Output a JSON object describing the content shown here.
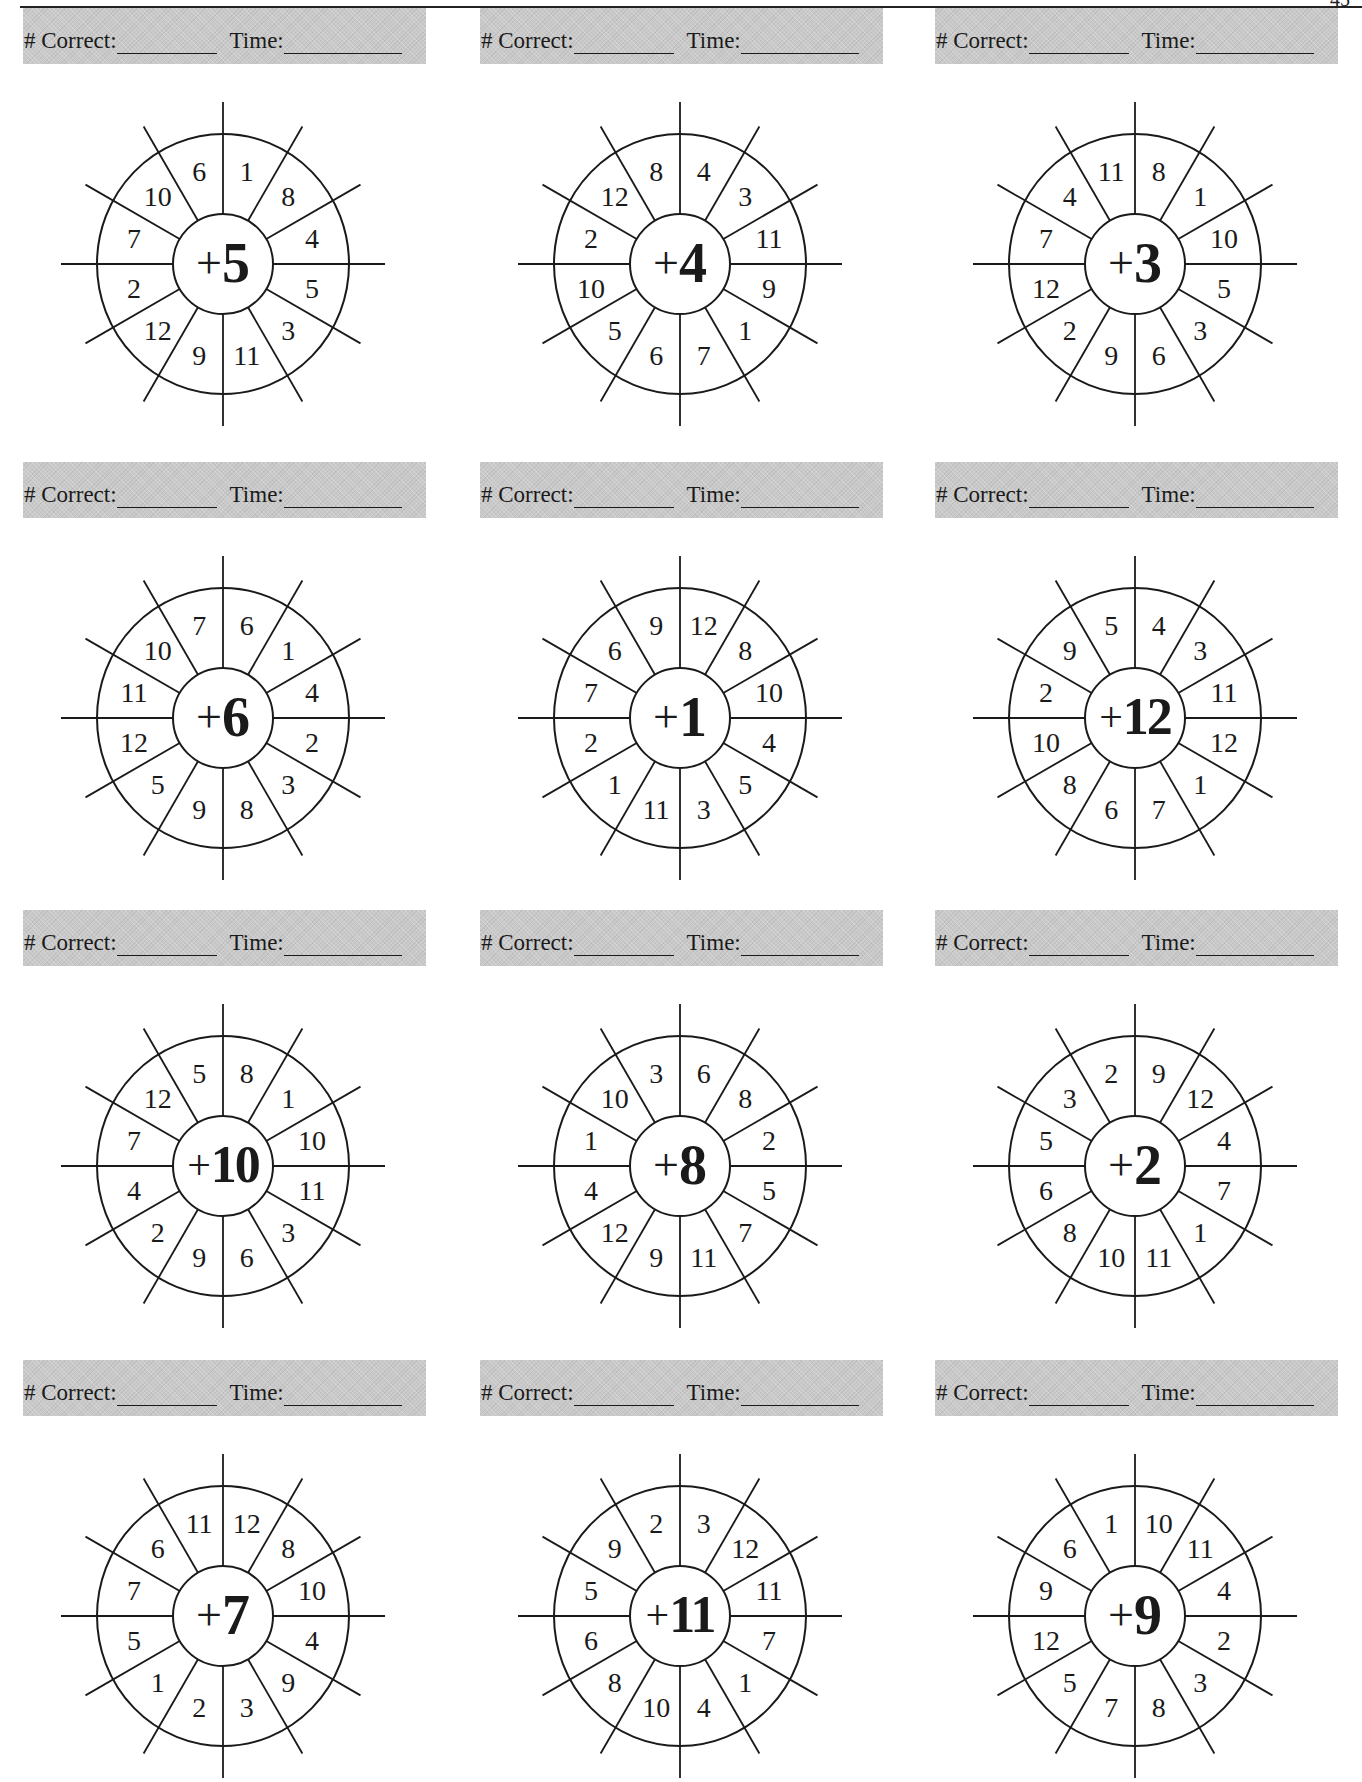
{
  "page": {
    "page_number": "45",
    "header_labels": {
      "correct": "# Correct:",
      "time": "Time:"
    }
  },
  "wheels": [
    {
      "addend": "5",
      "numbers": [
        "1",
        "8",
        "4",
        "5",
        "3",
        "11",
        "9",
        "12",
        "2",
        "7",
        "10",
        "6"
      ]
    },
    {
      "addend": "4",
      "numbers": [
        "4",
        "3",
        "11",
        "9",
        "1",
        "7",
        "6",
        "5",
        "10",
        "2",
        "12",
        "8"
      ]
    },
    {
      "addend": "3",
      "numbers": [
        "8",
        "1",
        "10",
        "5",
        "3",
        "6",
        "9",
        "2",
        "12",
        "7",
        "4",
        "11"
      ]
    },
    {
      "addend": "6",
      "numbers": [
        "6",
        "1",
        "4",
        "2",
        "3",
        "8",
        "9",
        "5",
        "12",
        "11",
        "10",
        "7"
      ]
    },
    {
      "addend": "1",
      "numbers": [
        "12",
        "8",
        "10",
        "4",
        "5",
        "3",
        "11",
        "1",
        "2",
        "7",
        "6",
        "9"
      ]
    },
    {
      "addend": "12",
      "numbers": [
        "4",
        "3",
        "11",
        "12",
        "1",
        "7",
        "6",
        "8",
        "10",
        "2",
        "9",
        "5"
      ]
    },
    {
      "addend": "10",
      "numbers": [
        "8",
        "1",
        "10",
        "11",
        "3",
        "6",
        "9",
        "2",
        "4",
        "7",
        "12",
        "5"
      ]
    },
    {
      "addend": "8",
      "numbers": [
        "6",
        "8",
        "2",
        "5",
        "7",
        "11",
        "9",
        "12",
        "4",
        "1",
        "10",
        "3"
      ]
    },
    {
      "addend": "2",
      "numbers": [
        "9",
        "12",
        "4",
        "7",
        "1",
        "11",
        "10",
        "8",
        "6",
        "5",
        "3",
        "2"
      ]
    },
    {
      "addend": "7",
      "numbers": [
        "12",
        "8",
        "10",
        "4",
        "9",
        "3",
        "2",
        "1",
        "5",
        "7",
        "6",
        "11"
      ]
    },
    {
      "addend": "11",
      "numbers": [
        "3",
        "12",
        "11",
        "7",
        "1",
        "4",
        "10",
        "8",
        "6",
        "5",
        "9",
        "2"
      ]
    },
    {
      "addend": "9",
      "numbers": [
        "10",
        "11",
        "4",
        "2",
        "3",
        "8",
        "7",
        "5",
        "12",
        "9",
        "6",
        "1"
      ]
    }
  ],
  "labels": {
    "plus_sign": "+"
  }
}
